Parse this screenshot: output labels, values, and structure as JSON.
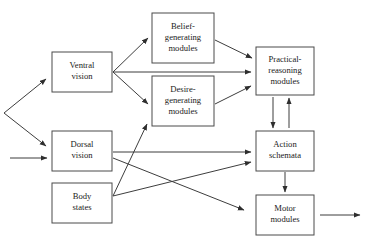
{
  "diagram": {
    "background_color": "#ffffff",
    "box_stroke_color": "#4a4a4a",
    "arrow_color": "#3d3d3d",
    "text_color": "#1a1a1a",
    "nodes": [
      {
        "id": "ventral-vision",
        "lines": [
          "Ventral",
          "vision"
        ],
        "x": 52,
        "y": 52,
        "w": 60,
        "h": 40
      },
      {
        "id": "belief-generating-modules",
        "lines": [
          "Belief-",
          "generating",
          "modules"
        ],
        "x": 152,
        "y": 13,
        "w": 62,
        "h": 50
      },
      {
        "id": "desire-generating-modules",
        "lines": [
          "Desire-",
          "generating",
          "modules"
        ],
        "x": 152,
        "y": 76,
        "w": 62,
        "h": 50
      },
      {
        "id": "practical-reasoning-modules",
        "lines": [
          "Practical-",
          "reasoning",
          "modules"
        ],
        "x": 256,
        "y": 47,
        "w": 58,
        "h": 48
      },
      {
        "id": "dorsal-vision",
        "lines": [
          "Dorsal",
          "vision"
        ],
        "x": 52,
        "y": 131,
        "w": 60,
        "h": 40
      },
      {
        "id": "action-schemata",
        "lines": [
          "Action",
          "schemata"
        ],
        "x": 256,
        "y": 131,
        "w": 58,
        "h": 40
      },
      {
        "id": "body-states",
        "lines": [
          "Body",
          "states"
        ],
        "x": 52,
        "y": 183,
        "w": 60,
        "h": 40
      },
      {
        "id": "motor-modules",
        "lines": [
          "Motor",
          "modules"
        ],
        "x": 256,
        "y": 195,
        "w": 58,
        "h": 40
      }
    ],
    "edges": [
      {
        "id": "input-fork-to-ventral",
        "from": "external-input",
        "to": "ventral-vision",
        "x1": 4,
        "y1": 113,
        "x2": 46,
        "y2": 79
      },
      {
        "id": "input-fork-to-dorsal",
        "from": "external-input",
        "to": "dorsal-vision",
        "x1": 4,
        "y1": 113,
        "x2": 46,
        "y2": 146
      },
      {
        "id": "external-input-to-dorsal",
        "from": "external-input",
        "to": "dorsal-vision",
        "x1": 10,
        "y1": 158,
        "x2": 47,
        "y2": 158
      },
      {
        "id": "ventral-to-belief",
        "from": "ventral-vision",
        "to": "belief-generating-modules",
        "x1": 113,
        "y1": 72,
        "x2": 148,
        "y2": 38
      },
      {
        "id": "ventral-to-practical",
        "from": "ventral-vision",
        "to": "practical-reasoning-modules",
        "x1": 113,
        "y1": 72,
        "x2": 251,
        "y2": 72
      },
      {
        "id": "ventral-to-desire",
        "from": "ventral-vision",
        "to": "desire-generating-modules",
        "x1": 113,
        "y1": 72,
        "x2": 148,
        "y2": 104
      },
      {
        "id": "belief-to-practical",
        "from": "belief-generating-modules",
        "to": "practical-reasoning-modules",
        "x1": 215,
        "y1": 40,
        "x2": 252,
        "y2": 58
      },
      {
        "id": "desire-to-practical",
        "from": "desire-generating-modules",
        "to": "practical-reasoning-modules",
        "x1": 215,
        "y1": 104,
        "x2": 251,
        "y2": 86
      },
      {
        "id": "practical-to-action",
        "from": "practical-reasoning-modules",
        "to": "action-schemata",
        "x1": 273,
        "y1": 97,
        "x2": 273,
        "y2": 128
      },
      {
        "id": "action-to-practical",
        "from": "action-schemata",
        "to": "practical-reasoning-modules",
        "x1": 289,
        "y1": 128,
        "x2": 289,
        "y2": 98
      },
      {
        "id": "dorsal-to-action",
        "from": "dorsal-vision",
        "to": "action-schemata",
        "x1": 113,
        "y1": 152,
        "x2": 251,
        "y2": 152
      },
      {
        "id": "dorsal-to-motor",
        "from": "dorsal-vision",
        "to": "motor-modules",
        "x1": 113,
        "y1": 158,
        "x2": 244,
        "y2": 210
      },
      {
        "id": "body-to-desire",
        "from": "body-states",
        "to": "desire-generating-modules",
        "x1": 113,
        "y1": 196,
        "x2": 147,
        "y2": 124
      },
      {
        "id": "body-to-action",
        "from": "body-states",
        "to": "action-schemata",
        "x1": 113,
        "y1": 196,
        "x2": 251,
        "y2": 162
      },
      {
        "id": "action-to-motor",
        "from": "action-schemata",
        "to": "motor-modules",
        "x1": 285,
        "y1": 172,
        "x2": 285,
        "y2": 192
      },
      {
        "id": "motor-to-output",
        "from": "motor-modules",
        "to": "external-output",
        "x1": 320,
        "y1": 215,
        "x2": 360,
        "y2": 215
      }
    ]
  }
}
